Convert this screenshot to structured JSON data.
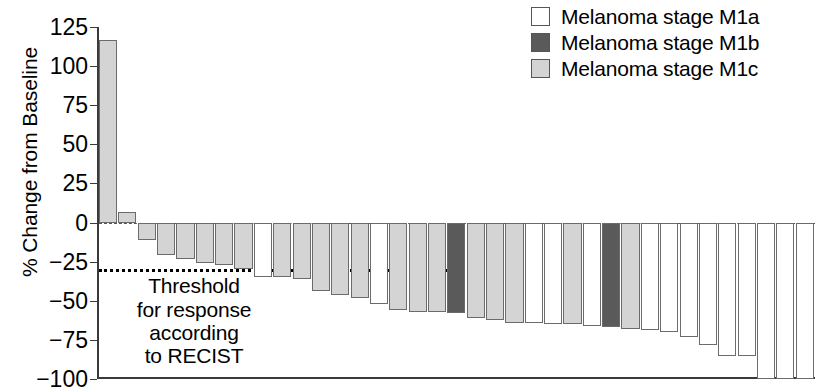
{
  "chart_data": {
    "type": "bar",
    "subtype": "waterfall",
    "title": "",
    "xlabel": "",
    "ylabel": "% Change from Baseline",
    "ylim": [
      -100,
      125
    ],
    "yticks": [
      125,
      100,
      75,
      50,
      25,
      0,
      -25,
      -50,
      -75,
      -100
    ],
    "ytick_labels": [
      "125",
      "100",
      "75",
      "50",
      "25",
      "0",
      "−25",
      "−50",
      "−75",
      "−100"
    ],
    "grid": false,
    "xaxis_visible": false,
    "reference_lines": [
      {
        "name": "zero-line",
        "value": 0,
        "style": "dashed"
      },
      {
        "name": "recist-threshold-line",
        "value": -30,
        "style": "dotted"
      }
    ],
    "annotations": [
      {
        "name": "recist-threshold-note",
        "lines": [
          "Threshold",
          "for response",
          "according",
          "to RECIST"
        ],
        "value_anchor": -30
      }
    ],
    "legend": {
      "position": "top-right",
      "entries": [
        {
          "label": "Melanoma stage M1a",
          "key": "M1a",
          "color": "#ffffff"
        },
        {
          "label": "Melanoma stage M1b",
          "key": "M1b",
          "color": "#5a5a5a"
        },
        {
          "label": "Melanoma stage M1c",
          "key": "M1c",
          "color": "#d4d4d4"
        }
      ]
    },
    "series": [
      {
        "name": "% Change from Baseline",
        "values": [
          117,
          7,
          -11,
          -21,
          -23,
          -26,
          -27,
          -30,
          -35,
          -35,
          -36,
          -44,
          -46,
          -48,
          -52,
          -56,
          -57,
          -57,
          -58,
          -61,
          -62,
          -64,
          -64,
          -65,
          -65,
          -66,
          -67,
          -68,
          -69,
          -70,
          -73,
          -78,
          -85,
          -85,
          -100,
          -100,
          -100
        ],
        "stages": [
          "M1c",
          "M1c",
          "M1c",
          "M1c",
          "M1c",
          "M1c",
          "M1c",
          "M1c",
          "M1a",
          "M1c",
          "M1c",
          "M1c",
          "M1c",
          "M1c",
          "M1a",
          "M1c",
          "M1c",
          "M1c",
          "M1b",
          "M1c",
          "M1c",
          "M1c",
          "M1a",
          "M1a",
          "M1c",
          "M1a",
          "M1b",
          "M1c",
          "M1a",
          "M1a",
          "M1a",
          "M1a",
          "M1a",
          "M1a",
          "M1a",
          "M1a",
          "M1a"
        ]
      }
    ]
  }
}
